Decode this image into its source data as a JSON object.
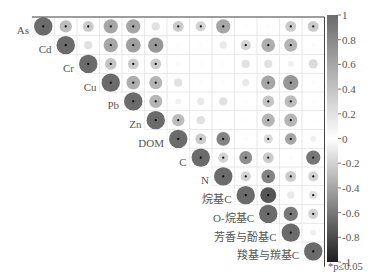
{
  "chart_data": {
    "type": "heatmap",
    "subtype": "correlation-upper-triangle-circles",
    "title": "",
    "variables": [
      "As",
      "Cd",
      "Cr",
      "Cu",
      "Pb",
      "Zn",
      "DOM",
      "C",
      "N",
      "烷基C",
      "O-烷基C",
      "芳香与酚基C",
      "羧基与羰基C"
    ],
    "matrix": [
      [
        1,
        0.45,
        0.35,
        0.6,
        0.6,
        0.2,
        0.35,
        0.3,
        0.6,
        0.05,
        0.05,
        0.35,
        0.35
      ],
      [
        null,
        1,
        0.2,
        0.6,
        0.65,
        0.7,
        0.05,
        0.0,
        0.15,
        0.3,
        0.55,
        0.5,
        0.0
      ],
      [
        null,
        null,
        1,
        0.4,
        0.35,
        0.35,
        0.0,
        0.0,
        0.0,
        0.2,
        0.2,
        0.1,
        0.25
      ],
      [
        null,
        null,
        null,
        1,
        0.55,
        0.5,
        0.2,
        0.0,
        0.0,
        0.15,
        0.6,
        0.7,
        0.0
      ],
      [
        null,
        null,
        null,
        null,
        1,
        0.5,
        0.1,
        0.15,
        0.2,
        0.0,
        0.4,
        0.45,
        0.0
      ],
      [
        null,
        null,
        null,
        null,
        null,
        1,
        0.45,
        0.2,
        0.05,
        0.05,
        0.5,
        0.5,
        0.05
      ],
      [
        null,
        null,
        null,
        null,
        null,
        null,
        1,
        0.35,
        -0.55,
        0.0,
        0.25,
        -0.4,
        0.1
      ],
      [
        null,
        null,
        null,
        null,
        null,
        null,
        null,
        1,
        0.3,
        -0.5,
        0.35,
        0.0,
        -0.6
      ],
      [
        null,
        null,
        null,
        null,
        null,
        null,
        null,
        null,
        1,
        0.3,
        -0.55,
        0.35,
        0.3
      ],
      [
        null,
        null,
        null,
        null,
        null,
        null,
        null,
        null,
        null,
        1,
        -0.75,
        0.15,
        0.2
      ],
      [
        null,
        null,
        null,
        null,
        null,
        null,
        null,
        null,
        null,
        null,
        1,
        -0.6,
        0.3
      ],
      [
        null,
        null,
        null,
        null,
        null,
        null,
        null,
        null,
        null,
        null,
        null,
        1,
        0.1
      ],
      [
        null,
        null,
        null,
        null,
        null,
        null,
        null,
        null,
        null,
        null,
        null,
        null,
        1
      ]
    ],
    "significant": [
      [
        1,
        1,
        1,
        1,
        1,
        0,
        1,
        1,
        1,
        0,
        0,
        1,
        1
      ],
      [
        0,
        1,
        0,
        1,
        1,
        1,
        0,
        0,
        0,
        1,
        1,
        1,
        0
      ],
      [
        0,
        0,
        1,
        1,
        1,
        1,
        0,
        0,
        0,
        0,
        0,
        0,
        0
      ],
      [
        0,
        0,
        0,
        1,
        1,
        1,
        0,
        0,
        0,
        0,
        1,
        1,
        0
      ],
      [
        0,
        0,
        0,
        0,
        1,
        1,
        0,
        0,
        0,
        0,
        1,
        1,
        0
      ],
      [
        0,
        0,
        0,
        0,
        0,
        1,
        1,
        0,
        0,
        0,
        1,
        1,
        0
      ],
      [
        0,
        0,
        0,
        0,
        0,
        0,
        1,
        1,
        1,
        0,
        1,
        1,
        0
      ],
      [
        0,
        0,
        0,
        0,
        0,
        0,
        0,
        1,
        1,
        1,
        1,
        0,
        1
      ],
      [
        0,
        0,
        0,
        0,
        0,
        0,
        0,
        0,
        1,
        1,
        1,
        1,
        1
      ],
      [
        0,
        0,
        0,
        0,
        0,
        0,
        0,
        0,
        0,
        1,
        1,
        0,
        1
      ],
      [
        0,
        0,
        0,
        0,
        0,
        0,
        0,
        0,
        0,
        0,
        1,
        1,
        1
      ],
      [
        0,
        0,
        0,
        0,
        0,
        0,
        0,
        0,
        0,
        0,
        0,
        1,
        0
      ],
      [
        0,
        0,
        0,
        0,
        0,
        0,
        0,
        0,
        0,
        0,
        0,
        0,
        1
      ]
    ],
    "colorbar": {
      "range": [
        -1,
        1
      ],
      "ticks": [
        "1",
        "0.8",
        "0.6",
        "0.4",
        "0.2",
        "0",
        "-0.2",
        "-0.4",
        "-0.6",
        "-0.8",
        "-1"
      ],
      "colors": {
        "positive": "#6b6b6b",
        "zero": "#ffffff",
        "negative": "#1e1e1e"
      }
    },
    "annotation": "*p≤0.05",
    "grid": true,
    "legend_position": "right"
  }
}
